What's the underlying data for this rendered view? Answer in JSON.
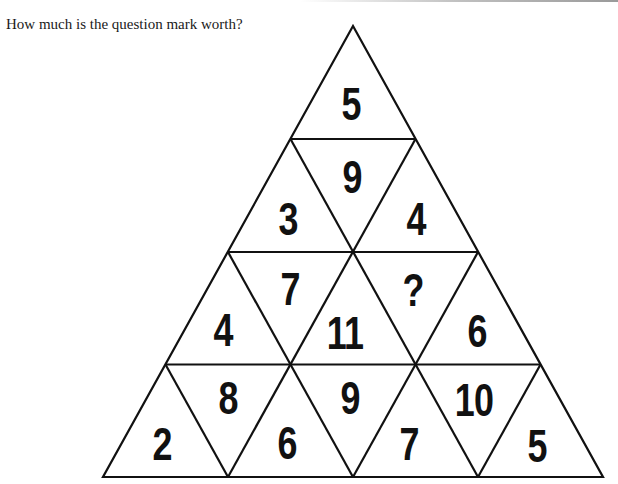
{
  "header": {
    "question": "How much is the question mark worth?"
  },
  "puzzle": {
    "shape": "triangle-of-triangles",
    "rows": 4,
    "line_color": "#111111",
    "text_color": "#111111",
    "cells": [
      {
        "row": 1,
        "pos": 1,
        "orientation": "up",
        "value": "5"
      },
      {
        "row": 2,
        "pos": 1,
        "orientation": "up",
        "value": "3"
      },
      {
        "row": 2,
        "pos": 2,
        "orientation": "down",
        "value": "9"
      },
      {
        "row": 2,
        "pos": 3,
        "orientation": "up",
        "value": "4"
      },
      {
        "row": 3,
        "pos": 1,
        "orientation": "up",
        "value": "4"
      },
      {
        "row": 3,
        "pos": 2,
        "orientation": "down",
        "value": "7"
      },
      {
        "row": 3,
        "pos": 3,
        "orientation": "up",
        "value": "11"
      },
      {
        "row": 3,
        "pos": 4,
        "orientation": "down",
        "value": "?"
      },
      {
        "row": 3,
        "pos": 5,
        "orientation": "up",
        "value": "6"
      },
      {
        "row": 4,
        "pos": 1,
        "orientation": "up",
        "value": "2"
      },
      {
        "row": 4,
        "pos": 2,
        "orientation": "down",
        "value": "8"
      },
      {
        "row": 4,
        "pos": 3,
        "orientation": "up",
        "value": "6"
      },
      {
        "row": 4,
        "pos": 4,
        "orientation": "down",
        "value": "9"
      },
      {
        "row": 4,
        "pos": 5,
        "orientation": "up",
        "value": "7"
      },
      {
        "row": 4,
        "pos": 6,
        "orientation": "down",
        "value": "10"
      },
      {
        "row": 4,
        "pos": 7,
        "orientation": "up",
        "value": "5"
      }
    ]
  }
}
